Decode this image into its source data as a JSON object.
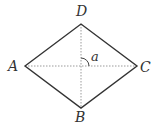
{
  "diagram": {
    "type": "rhombus",
    "vertices": [
      {
        "name": "A",
        "x": 25,
        "y": 66
      },
      {
        "name": "B",
        "x": 81,
        "y": 108
      },
      {
        "name": "C",
        "x": 137,
        "y": 66
      },
      {
        "name": "D",
        "x": 81,
        "y": 24
      }
    ],
    "labels": {
      "A": "A",
      "B": "B",
      "C": "C",
      "D": "D",
      "angle": "a"
    },
    "diagonals": [
      "AC",
      "BD"
    ],
    "diagonal_style": "dotted",
    "angle_marker": "between diagonals at center, upper-right quadrant",
    "colors": {
      "edge": "#333333",
      "diagonal": "#999999",
      "label": "#333333"
    }
  }
}
